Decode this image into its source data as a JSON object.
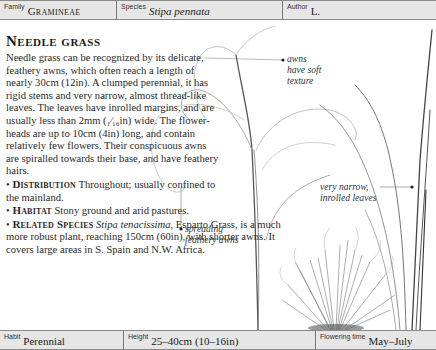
{
  "header": {
    "family": {
      "label": "Family",
      "value": "Gramineae"
    },
    "species": {
      "label": "Species",
      "value": "Stipa pennata"
    },
    "author": {
      "label": "Author",
      "value": "L."
    }
  },
  "article": {
    "title": "Needle grass",
    "description": "Needle grass can be recognized by its delicate, feathery awns, which often reach a length of nearly 30cm (12in). A clumped perennial, it has rigid stems and very narrow, almost thread-like leaves. The leaves have inrolled margins, and are usually less than 2mm (₁⁄₁₆in) wide. The flower-heads are up to 10cm (4in) long, and contain relatively few flowers. Their conspicuous awns are spiralled towards their base, and have feathery hairs.",
    "sections": [
      {
        "bullet": "•",
        "heading": "Distribution",
        "text": " Throughout; usually confined to the mainland."
      },
      {
        "bullet": "•",
        "heading": "Habitat",
        "text": " Stony ground and arid pastures."
      },
      {
        "bullet": "•",
        "heading": "Related Species",
        "species": "Stipa tenacissima",
        "text": ", Esparto Grass, is a much more robust plant, reaching 150cm (60in), with shorter awns. It covers large areas in S. Spain and N.W. Africa."
      }
    ]
  },
  "illustration": {
    "callouts": [
      {
        "bullet": "•",
        "lines": [
          "awns",
          "have soft",
          "texture"
        ]
      },
      {
        "bullet": "•",
        "lines": [
          "very narrow,",
          "inrolled leaves"
        ]
      },
      {
        "bullet": "•",
        "lines": [
          "spreading",
          "feathery awns"
        ]
      }
    ]
  },
  "footer": {
    "habit": {
      "label": "Habit",
      "value": "Perennial"
    },
    "height": {
      "label": "Height",
      "value": "25–40cm (10–16in)"
    },
    "flowering": {
      "label": "Flowering time",
      "value": "May–July"
    }
  }
}
